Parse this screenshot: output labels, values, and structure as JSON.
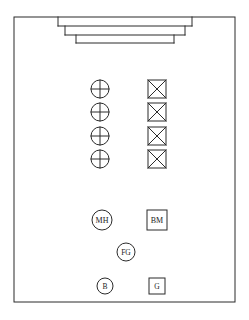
{
  "sheet": {
    "width": 249,
    "height": 320,
    "background_color": "#ffffff",
    "ink_color": "#2b2b2b",
    "label_color": "#1c1c1c"
  },
  "border": {
    "name": "sheet-border",
    "x": 14,
    "y": 17,
    "width": 221,
    "height": 285
  },
  "stepped_structure": {
    "name": "stepped-nested-outline",
    "description": "three nested stepped rectangles descending from the top border",
    "steps": [
      {
        "x": 58,
        "y": 17,
        "width": 134,
        "height": 9
      },
      {
        "x": 65,
        "y": 26,
        "width": 120,
        "height": 9
      },
      {
        "x": 76,
        "y": 35,
        "width": 98,
        "height": 8
      }
    ]
  },
  "symbol_columns": [
    {
      "name": "crossed-circle-column",
      "shape": "circle-with-cross",
      "center_x": 100,
      "radius": 9,
      "rows_y": [
        89,
        112,
        136,
        159
      ]
    },
    {
      "name": "crossed-square-column",
      "shape": "square-with-x",
      "center_x": 157,
      "half_size": 9,
      "rows_y": [
        89,
        112,
        136,
        159
      ]
    }
  ],
  "labeled_symbols": [
    {
      "name": "symbol-manhole",
      "label": "MH",
      "shape": "circle",
      "cx": 102,
      "cy": 220,
      "r": 10,
      "font_size": 8
    },
    {
      "name": "symbol-benchmark",
      "label": "BM",
      "shape": "square",
      "cx": 157,
      "cy": 220,
      "half": 10,
      "font_size": 8
    },
    {
      "name": "symbol-finished-ground",
      "label": "FG",
      "shape": "circle",
      "cx": 126,
      "cy": 252,
      "r": 9,
      "font_size": 7.5
    },
    {
      "name": "symbol-b",
      "label": "B",
      "shape": "circle",
      "cx": 105,
      "cy": 286,
      "r": 8,
      "font_size": 7.5
    },
    {
      "name": "symbol-g",
      "label": "G",
      "shape": "square",
      "cx": 157,
      "cy": 286,
      "half": 8,
      "font_size": 7.5
    }
  ]
}
